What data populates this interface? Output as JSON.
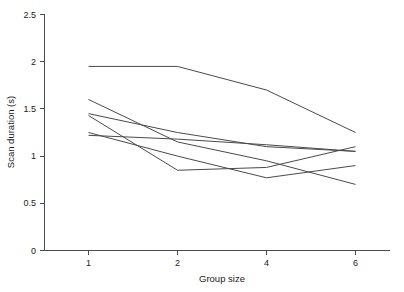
{
  "chart_data": {
    "type": "line",
    "title": "",
    "xlabel": "Group size",
    "ylabel": "Scan duration (s)",
    "categories": [
      "1",
      "2",
      "4",
      "6"
    ],
    "x_tick_labels": [
      "1",
      "2",
      "4",
      "6"
    ],
    "y_tick_labels": [
      "0",
      "0.5",
      "1",
      "1.5",
      "2",
      "2.5"
    ],
    "y_tick_values": [
      0,
      0.5,
      1,
      1.5,
      2,
      2.5
    ],
    "ylim": [
      0,
      2.5
    ],
    "grid": false,
    "legend": false,
    "legend_position": "none",
    "line_color": "#4a4a4a",
    "axis_color": "#4d4d4d",
    "series": [
      {
        "name": "series-1",
        "values": [
          1.95,
          1.95,
          1.7,
          1.25
        ]
      },
      {
        "name": "series-2",
        "values": [
          1.6,
          1.15,
          0.95,
          0.7
        ]
      },
      {
        "name": "series-3",
        "values": [
          1.45,
          1.25,
          1.1,
          1.05
        ]
      },
      {
        "name": "series-4",
        "values": [
          1.43,
          0.85,
          0.88,
          1.1
        ]
      },
      {
        "name": "series-5",
        "values": [
          1.25,
          1.0,
          0.77,
          0.9
        ]
      },
      {
        "name": "series-6",
        "values": [
          1.22,
          1.18,
          1.12,
          1.05
        ]
      }
    ]
  },
  "axes": {
    "x_title": "Group size",
    "y_title": "Scan duration (s)",
    "y_labels": {
      "t0": "0",
      "t1": "0.5",
      "t2": "1",
      "t3": "1.5",
      "t4": "2",
      "t5": "2.5"
    },
    "x_labels": {
      "c0": "1",
      "c1": "2",
      "c2": "4",
      "c3": "6"
    }
  }
}
